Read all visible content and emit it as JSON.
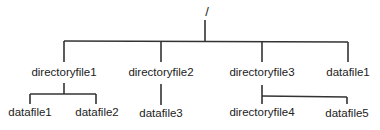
{
  "diagram": {
    "type": "directory-tree",
    "root": {
      "label": "/"
    },
    "level1": [
      {
        "label": "directoryfile1"
      },
      {
        "label": "directoryfile2"
      },
      {
        "label": "directoryfile3"
      },
      {
        "label": "datafile1"
      }
    ],
    "level2": [
      {
        "label": "datafile1",
        "parent": "directoryfile1"
      },
      {
        "label": "datafile2",
        "parent": "directoryfile1"
      },
      {
        "label": "datafile3",
        "parent": "directoryfile2"
      },
      {
        "label": "directoryfile4",
        "parent": "directoryfile3"
      },
      {
        "label": "datafile5",
        "parent": "directoryfile3"
      }
    ]
  }
}
